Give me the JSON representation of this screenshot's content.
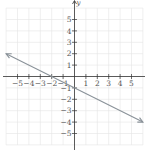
{
  "chart_data": {
    "type": "line",
    "title": "",
    "xlabel": "x",
    "ylabel": "y",
    "xlim": [
      -6,
      6
    ],
    "ylim": [
      -6,
      6
    ],
    "grid": true,
    "x_ticks": [
      -5,
      -4,
      -3,
      -2,
      -1,
      1,
      2,
      3,
      4,
      5
    ],
    "y_ticks": [
      -5,
      -4,
      -3,
      -2,
      -1,
      1,
      2,
      3,
      4,
      5
    ],
    "x_tick_labels": [
      "−5",
      "−4",
      "−3",
      "−2",
      "−1",
      "1",
      "2",
      "3",
      "4",
      "5"
    ],
    "y_tick_labels": [
      "−5",
      "−4",
      "−3",
      "−2",
      "−1",
      "1",
      "2",
      "3",
      "4",
      "5"
    ],
    "series": [
      {
        "name": "y = -x/2 - 1",
        "equation": "y = -0.5x - 1",
        "slope": -0.5,
        "intercept": -1,
        "x": [
          -6,
          -2,
          0,
          6
        ],
        "y": [
          2,
          0,
          -1,
          -4
        ],
        "arrows": "both",
        "color": "#8a9299"
      }
    ]
  },
  "labels": {
    "y_axis": "y"
  }
}
